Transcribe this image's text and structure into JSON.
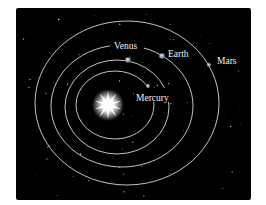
{
  "diagram": {
    "background_color": "#000000",
    "orbit_color": "#d8d8d8",
    "sun": {
      "name": "Sun",
      "color": "#ffffff"
    },
    "planets": [
      {
        "name": "Mercury",
        "label": "Mercury"
      },
      {
        "name": "Venus",
        "label": "Venus"
      },
      {
        "name": "Earth",
        "label": "Earth"
      },
      {
        "name": "Mars",
        "label": "Mars"
      }
    ]
  }
}
